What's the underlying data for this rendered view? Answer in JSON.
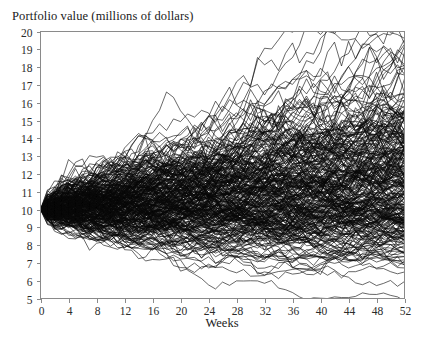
{
  "chart_data": {
    "type": "line",
    "title": "Portfolio value (millions of dollars)",
    "xlabel": "Weeks",
    "ylabel": "",
    "xlim": [
      0,
      52
    ],
    "ylim": [
      5,
      20
    ],
    "grid": false,
    "legend": "none",
    "x_ticks": [
      0,
      4,
      8,
      12,
      16,
      20,
      24,
      28,
      32,
      36,
      40,
      44,
      48,
      52
    ],
    "x_tick_labels": [
      "0",
      "4",
      "8",
      "12",
      "16",
      "20",
      "24",
      "28",
      "32",
      "36",
      "40",
      "44",
      "48",
      "52"
    ],
    "y_ticks": [
      5,
      6,
      7,
      8,
      9,
      10,
      11,
      12,
      13,
      14,
      15,
      16,
      17,
      18,
      19,
      20
    ],
    "y_tick_labels": [
      "5",
      "6",
      "7",
      "8",
      "9",
      "10",
      "11",
      "12",
      "13",
      "14",
      "15",
      "16",
      "17",
      "18",
      "19",
      "20"
    ],
    "x_minor_step": 4,
    "series_description": "Monte Carlo simulation of portfolio value random walks",
    "series_count": 300,
    "start_value": 10,
    "start_week": 0,
    "weekly_drift": 0.0032,
    "weekly_volatility": 0.0345,
    "random_seed": 20240917,
    "envelope_week52_max": 18.4,
    "envelope_week52_min": 6.1,
    "envelope_week26_max": 14.6,
    "envelope_week26_min": 7.0,
    "line_color": "#0a0a0a",
    "axis_color": "#8a8a8a",
    "background_color": "#ffffff"
  },
  "axis_labels": {
    "x_title": "Weeks"
  }
}
